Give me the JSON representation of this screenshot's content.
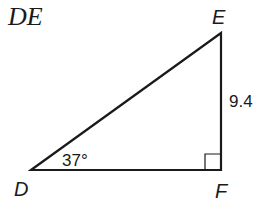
{
  "title": "DE",
  "triangle": {
    "vertices": {
      "D": {
        "label": "D",
        "x": 31,
        "y": 170
      },
      "E": {
        "label": "E",
        "x": 221,
        "y": 33
      },
      "F": {
        "label": "F",
        "x": 221,
        "y": 170
      }
    },
    "side_EF": "9.4",
    "angle_D": "37°",
    "right_angle_at": "F",
    "stroke_color": "#1a1a1a"
  }
}
